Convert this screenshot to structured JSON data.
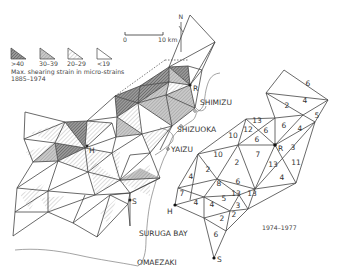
{
  "legend": {
    "title": "Max. shearing strain in micro-strains",
    "period": "1885–1974",
    "classes": [
      {
        "label": ">40",
        "fill": "dense"
      },
      {
        "label": "30–39",
        "fill": "medium"
      },
      {
        "label": "20–29",
        "fill": "light"
      },
      {
        "label": "<19",
        "fill": "none"
      }
    ]
  },
  "scale_bar": {
    "start": "0",
    "end": "10 km"
  },
  "north_arrow": {
    "label": "N"
  },
  "places": {
    "shimizu": "SHIMIZU",
    "shizuoka": "SHIZUOKA",
    "yaizu": "YAIZU",
    "suruga_bay": "SURUGA BAY",
    "omaezaki": "OMAEZAKI"
  },
  "stations_left": {
    "r": "R",
    "h": "H",
    "s": "S"
  },
  "stations_right": {
    "r": "R",
    "h": "H",
    "s": "S"
  },
  "right_network": {
    "period": "1974–1977",
    "values": [
      {
        "v": "6",
        "x": 308,
        "y": 86
      },
      {
        "v": "4",
        "x": 305,
        "y": 103
      },
      {
        "v": "2",
        "x": 287,
        "y": 108
      },
      {
        "v": "5",
        "x": 317,
        "y": 118
      },
      {
        "v": "13",
        "x": 257,
        "y": 123
      },
      {
        "v": "12",
        "x": 248,
        "y": 132
      },
      {
        "v": "6",
        "x": 266,
        "y": 133
      },
      {
        "v": "6",
        "x": 284,
        "y": 128
      },
      {
        "v": "4",
        "x": 300,
        "y": 131
      },
      {
        "v": "10",
        "x": 233,
        "y": 138
      },
      {
        "v": "6",
        "x": 257,
        "y": 142
      },
      {
        "v": "10",
        "x": 218,
        "y": 157
      },
      {
        "v": "7",
        "x": 258,
        "y": 157
      },
      {
        "v": "2",
        "x": 237,
        "y": 165
      },
      {
        "v": "3",
        "x": 293,
        "y": 150
      },
      {
        "v": "11",
        "x": 296,
        "y": 165
      },
      {
        "v": "13",
        "x": 273,
        "y": 167
      },
      {
        "v": "2",
        "x": 208,
        "y": 172
      },
      {
        "v": "4",
        "x": 191,
        "y": 179
      },
      {
        "v": "8",
        "x": 219,
        "y": 186
      },
      {
        "v": "6",
        "x": 238,
        "y": 184
      },
      {
        "v": "4",
        "x": 282,
        "y": 180
      },
      {
        "v": "7",
        "x": 182,
        "y": 196
      },
      {
        "v": "5",
        "x": 224,
        "y": 201
      },
      {
        "v": "13",
        "x": 236,
        "y": 196
      },
      {
        "v": "13",
        "x": 252,
        "y": 196
      },
      {
        "v": "4",
        "x": 196,
        "y": 205
      },
      {
        "v": "4",
        "x": 212,
        "y": 207
      },
      {
        "v": "3",
        "x": 238,
        "y": 208
      },
      {
        "v": "2",
        "x": 222,
        "y": 221
      },
      {
        "v": "2",
        "x": 234,
        "y": 217
      },
      {
        "v": "6",
        "x": 216,
        "y": 237
      }
    ]
  }
}
